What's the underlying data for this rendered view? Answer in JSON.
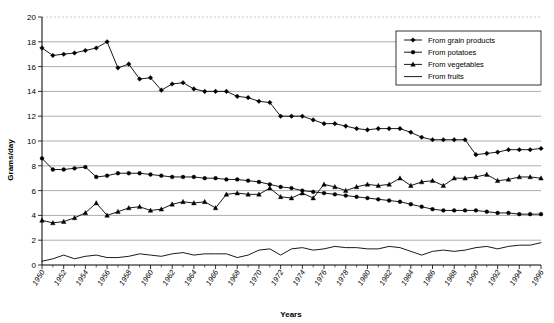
{
  "chart_data": {
    "type": "line",
    "title": "",
    "xlabel": "Years",
    "ylabel": "Grams/day",
    "ylim": [
      0,
      20
    ],
    "ytick_step": 2,
    "yticks": [
      0,
      2,
      4,
      6,
      8,
      10,
      12,
      14,
      16,
      18,
      20
    ],
    "grid": true,
    "legend_position": "top-right",
    "x": [
      1950,
      1951,
      1952,
      1953,
      1954,
      1955,
      1956,
      1957,
      1958,
      1959,
      1960,
      1961,
      1962,
      1963,
      1964,
      1965,
      1966,
      1967,
      1968,
      1969,
      1970,
      1971,
      1972,
      1973,
      1974,
      1975,
      1976,
      1977,
      1978,
      1979,
      1980,
      1981,
      1982,
      1983,
      1984,
      1985,
      1986,
      1987,
      1988,
      1989,
      1990,
      1991,
      1992,
      1993,
      1994,
      1995,
      1996
    ],
    "xtick_labels": [
      "1950",
      "1952",
      "1954",
      "1956",
      "1958",
      "1960",
      "1962",
      "1964",
      "1966",
      "1968",
      "1970",
      "1972",
      "1974",
      "1976",
      "1978",
      "1980",
      "1982",
      "1984",
      "1986",
      "1988",
      "1990",
      "1992",
      "1994",
      "1996"
    ],
    "series": [
      {
        "name": "From grain products",
        "marker": "diamond",
        "values": [
          17.5,
          16.9,
          17.0,
          17.1,
          17.3,
          17.5,
          18.0,
          15.9,
          16.2,
          15.0,
          15.1,
          14.1,
          14.6,
          14.7,
          14.2,
          14.0,
          14.0,
          14.0,
          13.6,
          13.5,
          13.2,
          13.1,
          12.0,
          12.0,
          12.0,
          11.7,
          11.4,
          11.4,
          11.2,
          11.0,
          10.9,
          11.0,
          11.0,
          11.0,
          10.7,
          10.3,
          10.1,
          10.1,
          10.1,
          10.1,
          8.9,
          9.0,
          9.1,
          9.3,
          9.3,
          9.3,
          9.4
        ]
      },
      {
        "name": "From potatoes",
        "marker": "circle",
        "values": [
          8.6,
          7.7,
          7.7,
          7.8,
          7.9,
          7.1,
          7.2,
          7.4,
          7.4,
          7.4,
          7.3,
          7.2,
          7.1,
          7.1,
          7.1,
          7.0,
          7.0,
          6.9,
          6.9,
          6.8,
          6.7,
          6.5,
          6.3,
          6.2,
          6.0,
          5.9,
          5.8,
          5.7,
          5.6,
          5.5,
          5.4,
          5.3,
          5.2,
          5.1,
          4.9,
          4.7,
          4.5,
          4.4,
          4.4,
          4.4,
          4.4,
          4.3,
          4.2,
          4.2,
          4.1,
          4.1,
          4.1
        ]
      },
      {
        "name": "From vegetables",
        "marker": "triangle",
        "values": [
          3.6,
          3.4,
          3.5,
          3.8,
          4.2,
          5.0,
          4.0,
          4.3,
          4.6,
          4.7,
          4.4,
          4.5,
          4.9,
          5.1,
          5.0,
          5.1,
          4.6,
          5.7,
          5.8,
          5.7,
          5.7,
          6.2,
          5.5,
          5.4,
          5.8,
          5.4,
          6.5,
          6.3,
          6.0,
          6.3,
          6.5,
          6.4,
          6.5,
          7.0,
          6.4,
          6.7,
          6.8,
          6.4,
          7.0,
          7.0,
          7.1,
          7.3,
          6.8,
          6.9,
          7.1,
          7.1,
          7.0
        ]
      },
      {
        "name": "From fruits",
        "marker": "none",
        "values": [
          0.3,
          0.5,
          0.8,
          0.5,
          0.7,
          0.8,
          0.6,
          0.6,
          0.7,
          0.9,
          0.8,
          0.7,
          0.9,
          1.0,
          0.8,
          0.9,
          0.9,
          0.9,
          0.6,
          0.8,
          1.2,
          1.3,
          0.8,
          1.3,
          1.4,
          1.2,
          1.3,
          1.5,
          1.4,
          1.4,
          1.3,
          1.3,
          1.5,
          1.4,
          1.1,
          0.8,
          1.1,
          1.2,
          1.1,
          1.2,
          1.4,
          1.5,
          1.3,
          1.5,
          1.6,
          1.6,
          1.8
        ]
      }
    ]
  }
}
